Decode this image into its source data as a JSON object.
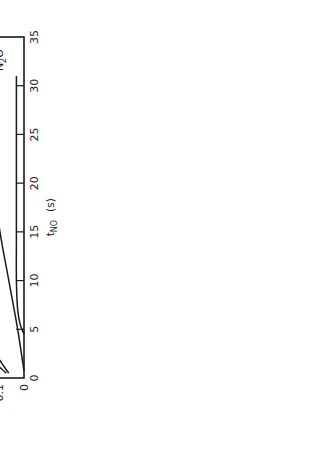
{
  "chart_data": {
    "type": "line",
    "orientation_note": "figure is printed rotated 90 degrees counter-clockwise",
    "title": "",
    "xlabel": "t_NO (s)",
    "xlabel_main": "t",
    "xlabel_sub": "NO",
    "xlabel_unit": "(s)",
    "ylabel": "I_i (arb. units)",
    "ylabel_main": "I",
    "ylabel_sub": "i",
    "ylabel_unit": "(arb. units)",
    "xlim": [
      0,
      35
    ],
    "ylim": [
      0,
      1.0
    ],
    "x_ticks": [
      0,
      5,
      10,
      15,
      20,
      25,
      30,
      35
    ],
    "x_tick_labels": [
      "0",
      "5",
      "10",
      "15",
      "20",
      "25",
      "30",
      "35"
    ],
    "y_ticks": [
      0,
      0.1,
      0.2,
      0.3,
      0.4,
      0.5,
      0.6,
      0.7,
      0.8,
      0.9,
      1.0
    ],
    "y_tick_labels": [
      "0",
      "0.1",
      "0.2",
      "0.3",
      "0.4",
      "0.5",
      "0.6",
      "0.7",
      "0.8",
      "0.9",
      "1.0"
    ],
    "grid": false,
    "legend": "inline labels at curve ends",
    "series": [
      {
        "name": "H2O",
        "label_main": "H",
        "label_sub": "2",
        "label_tail": "O",
        "x": [
          0.5,
          2,
          5,
          10,
          15,
          20,
          25,
          30
        ],
        "values": [
          0.07,
          0.13,
          0.22,
          0.36,
          0.49,
          0.55,
          0.655,
          0.75
        ]
      },
      {
        "name": "NH3",
        "label_main": "NH",
        "label_sub": "3",
        "label_tail": "",
        "x": [
          0.5,
          2,
          5,
          8,
          10,
          15,
          20,
          25,
          30
        ],
        "values": [
          0.06,
          0.1,
          0.16,
          0.225,
          0.25,
          0.275,
          0.285,
          0.3,
          0.32
        ]
      },
      {
        "name": "N2",
        "label_main": "N",
        "label_sub": "2",
        "label_tail": "",
        "x": [
          0.7,
          5,
          10,
          15,
          20,
          25,
          30
        ],
        "values": [
          0.0,
          0.025,
          0.06,
          0.095,
          0.12,
          0.155,
          0.19
        ]
      },
      {
        "name": "N2O",
        "label_main": "N",
        "label_sub": "2",
        "label_tail": "O",
        "x": [
          4.5,
          5.5,
          7,
          10,
          15,
          20,
          25,
          31
        ],
        "values": [
          0.0,
          0.015,
          0.025,
          0.03,
          0.03,
          0.03,
          0.03,
          0.03
        ]
      }
    ]
  }
}
